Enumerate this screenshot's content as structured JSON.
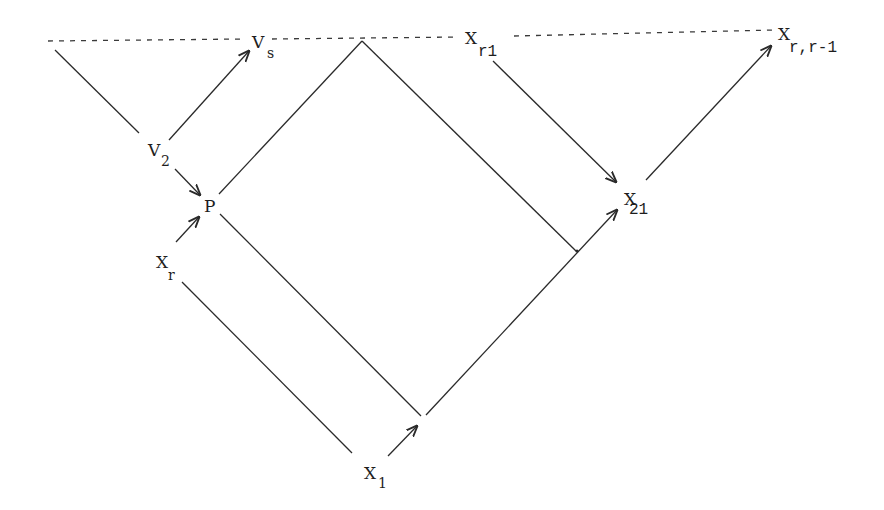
{
  "diagram": {
    "type": "commutative-style arrow diagram",
    "nodes": [
      {
        "id": "Vs",
        "main": "V",
        "sub": "s"
      },
      {
        "id": "V2",
        "main": "V",
        "sub": "2"
      },
      {
        "id": "P",
        "main": "P",
        "sub": ""
      },
      {
        "id": "Xr",
        "main": "X",
        "sub": "r"
      },
      {
        "id": "X1",
        "main": "X",
        "sub": "1"
      },
      {
        "id": "Xr1",
        "main": "X",
        "sub": "r1"
      },
      {
        "id": "X21",
        "main": "X",
        "sub": "21"
      },
      {
        "id": "Xrr1",
        "main": "X",
        "sub": "r,r-1"
      }
    ],
    "arrows": [
      {
        "from": "V2",
        "to": "Vs"
      },
      {
        "from": "V2",
        "to": "P"
      },
      {
        "from": "Xr",
        "to": "P"
      },
      {
        "from": "X1",
        "to": "lower-vertex"
      },
      {
        "from": "Xr1",
        "to": "X21"
      },
      {
        "from": "lower-vertex",
        "to": "X21"
      },
      {
        "from": "X21",
        "to": "Xrr1"
      }
    ],
    "lines": [
      {
        "desc": "dotted top horizontal line"
      },
      {
        "desc": "left edge from top-left toward V2"
      },
      {
        "desc": "P to apex"
      },
      {
        "desc": "apex down-right to junction"
      },
      {
        "desc": "P down-right to lower vertex"
      },
      {
        "desc": "Xr down-right to X1"
      }
    ]
  }
}
